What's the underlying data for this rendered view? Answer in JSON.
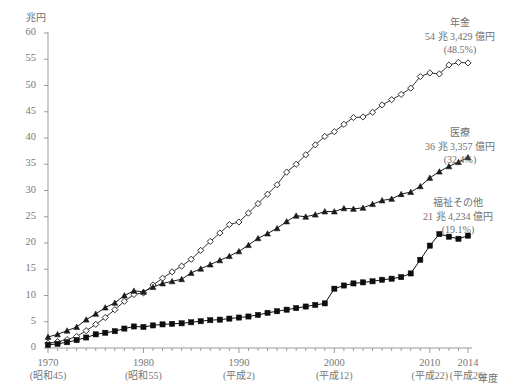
{
  "figure": {
    "y_unit_label": "兆円",
    "x_unit_label": "年度",
    "background": "#ffffff",
    "axis_color": "#9a9a9a"
  },
  "annotations": [
    {
      "name": "pension",
      "line1": "年金",
      "line2": "54 兆 3,429 億円",
      "line3": "(48.5%)"
    },
    {
      "name": "medical",
      "line1": "医療",
      "line2": "36 兆 3,357 億円",
      "line3": "(32.4%)"
    },
    {
      "name": "welfare",
      "line1": "福祉その他",
      "line2": "21 兆 4,234 億円",
      "line3": "(19.1%)"
    }
  ],
  "chart_data": {
    "type": "line",
    "title": "",
    "subtitle": "",
    "xlabel": "年度",
    "ylabel": "兆円",
    "xlim": [
      1970,
      2014
    ],
    "ylim": [
      0,
      60
    ],
    "ytick_step": 5,
    "yticks": [
      0,
      5,
      10,
      15,
      20,
      25,
      30,
      35,
      40,
      45,
      50,
      55,
      60
    ],
    "ytick_labels": [
      "0",
      "5",
      "10",
      "15",
      "20",
      "25",
      "30",
      "35",
      "40",
      "45",
      "50",
      "55",
      "60"
    ],
    "xticks": [
      1970,
      1980,
      1990,
      2000,
      2010,
      2014
    ],
    "xtick_labels": [
      "1970",
      "1980",
      "1990",
      "2000",
      "2010",
      "2014"
    ],
    "xtick_eras": [
      "(昭和45)",
      "(昭和55)",
      "(平成2)",
      "(平成12)",
      "(平成22)",
      "(平成26)"
    ],
    "xtick_minor_interval": 1,
    "grid": false,
    "legend_position": "right-inline-annotation",
    "x": [
      1970,
      1971,
      1972,
      1973,
      1974,
      1975,
      1976,
      1977,
      1978,
      1979,
      1980,
      1981,
      1982,
      1983,
      1984,
      1985,
      1986,
      1987,
      1988,
      1989,
      1990,
      1991,
      1992,
      1993,
      1994,
      1995,
      1996,
      1997,
      1998,
      1999,
      2000,
      2001,
      2002,
      2003,
      2004,
      2005,
      2006,
      2007,
      2008,
      2009,
      2010,
      2011,
      2012,
      2013,
      2014
    ],
    "series": [
      {
        "name": "年金",
        "label": "年金",
        "marker": "open-diamond",
        "color": "#333333",
        "end_value_text": "54 兆 3,429 億円",
        "end_share_text": "(48.5%)",
        "values": [
          0.9,
          1.2,
          1.6,
          2.2,
          3.3,
          4.5,
          5.8,
          7.3,
          8.9,
          10.2,
          10.5,
          12.0,
          13.3,
          14.5,
          15.6,
          16.9,
          18.6,
          20.3,
          21.9,
          23.5,
          24.0,
          25.7,
          27.5,
          29.3,
          31.1,
          33.5,
          35.0,
          36.8,
          38.7,
          40.3,
          41.2,
          42.6,
          43.9,
          44.0,
          44.9,
          46.3,
          47.3,
          48.3,
          49.5,
          51.7,
          52.4,
          52.2,
          53.9,
          54.4,
          54.3
        ]
      },
      {
        "name": "医療",
        "label": "医療",
        "marker": "filled-triangle",
        "color": "#1a1a1a",
        "end_value_text": "36 兆 3,357 億円",
        "end_share_text": "(32.4%)",
        "values": [
          2.1,
          2.6,
          3.3,
          4.0,
          5.4,
          6.5,
          7.7,
          8.6,
          10.0,
          10.9,
          10.7,
          11.6,
          12.3,
          12.7,
          13.1,
          14.3,
          15.1,
          15.9,
          16.7,
          17.5,
          18.4,
          19.6,
          20.9,
          21.8,
          22.8,
          24.1,
          25.2,
          25.0,
          25.4,
          26.0,
          26.0,
          26.6,
          26.5,
          26.7,
          27.4,
          28.1,
          28.4,
          29.3,
          29.7,
          30.8,
          32.4,
          33.6,
          34.6,
          35.4,
          36.3
        ]
      },
      {
        "name": "福祉その他",
        "label": "福祉その他",
        "marker": "filled-square",
        "color": "#0d0d0d",
        "end_value_text": "21 兆 4,234 億円",
        "end_share_text": "(19.1%)",
        "values": [
          0.6,
          0.8,
          1.1,
          1.5,
          2.0,
          2.6,
          2.9,
          3.2,
          3.7,
          4.1,
          4.0,
          4.3,
          4.5,
          4.6,
          4.7,
          4.9,
          5.1,
          5.3,
          5.4,
          5.6,
          5.8,
          6.0,
          6.3,
          6.7,
          7.0,
          7.3,
          7.6,
          7.9,
          8.2,
          8.5,
          11.3,
          11.9,
          12.3,
          12.5,
          12.7,
          13.0,
          13.2,
          13.5,
          14.2,
          16.8,
          19.5,
          21.7,
          21.2,
          20.8,
          21.4
        ]
      }
    ]
  }
}
